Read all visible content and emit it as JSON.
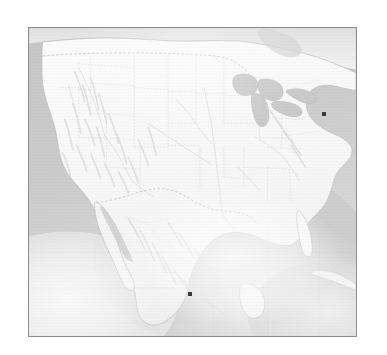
{
  "figure": {
    "kind": "map",
    "region": "North America",
    "style": "grayscale shaded-relief reference map",
    "frame": {
      "border_color": "#8d8d8d",
      "background_color": "#ffffff"
    }
  },
  "palette": {
    "page_background": "#ffffff",
    "frame_border": "#8d8d8d",
    "ocean": "#c9c9c9",
    "ocean_light": "#e8e8e8",
    "land": "#f7f7f7",
    "land_shadow": "#e3e3e3",
    "coastline": "#b4b4b4",
    "border_line": "#c2c2c2",
    "state_line": "#d2d2d2",
    "river": "#d8d8d8",
    "lake": "#cfcfcf",
    "marker": "#3a3a3a",
    "label_text": "#6f6f6f"
  },
  "map": {
    "water_bodies": [
      {
        "name": "Pacific Ocean"
      },
      {
        "name": "Atlantic Ocean"
      },
      {
        "name": "Gulf of Mexico"
      },
      {
        "name": "Gulf of California"
      },
      {
        "name": "Caribbean Sea"
      },
      {
        "name": "Great Lakes"
      },
      {
        "name": "Hudson Bay"
      }
    ],
    "countries": [
      {
        "name": "United States"
      },
      {
        "name": "Mexico"
      },
      {
        "name": "Canada"
      },
      {
        "name": "Cuba"
      },
      {
        "name": "Guatemala"
      },
      {
        "name": "Belize"
      },
      {
        "name": "Honduras"
      }
    ],
    "features": [
      {
        "name": "Baja California Peninsula"
      },
      {
        "name": "Florida Peninsula"
      },
      {
        "name": "Yucatan Peninsula"
      },
      {
        "name": "Rocky Mountains"
      },
      {
        "name": "Sierra Madre Occidental"
      },
      {
        "name": "Mississippi River"
      }
    ],
    "markers": [
      {
        "id": "marker-east-coast",
        "label": "",
        "x_pct": 90.3,
        "y_pct": 27.8,
        "show_label": true
      },
      {
        "id": "marker-central-mexico",
        "label": "",
        "x_pct": 49.2,
        "y_pct": 86.5,
        "show_label": true
      }
    ]
  }
}
